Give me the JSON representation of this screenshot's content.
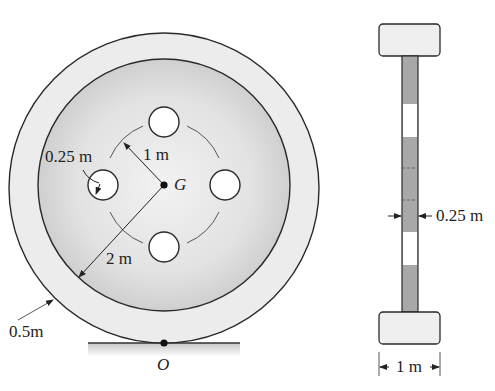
{
  "figure": {
    "type": "engineering-diagram"
  },
  "front_view": {
    "labels": {
      "hole_radius": "0.25 m",
      "hole_circle_radius": "1 m",
      "center": "G",
      "inner_radius": "2 m",
      "rim_thickness": "0.5m",
      "contact_point": "O"
    },
    "geometry": {
      "outer_radius_m": 2.5,
      "inner_radius_m": 2,
      "hole_count": 4,
      "hole_radius_m": 0.25,
      "hole_circle_radius_m": 1
    }
  },
  "side_view": {
    "labels": {
      "web_thickness": "0.25 m",
      "rim_width": "1 m"
    }
  },
  "colors": {
    "line": "#2a2a2a",
    "rim_fill": "#ececec",
    "disk_fill": "#dcdcdc",
    "web_fill": "#a8a8a8",
    "background": "#ffffff"
  }
}
